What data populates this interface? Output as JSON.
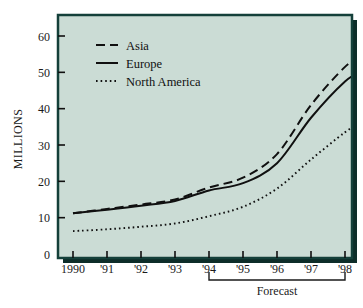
{
  "colors": {
    "plot_background": "#cbdcd5",
    "frame": "#14403a",
    "shadow": "#0d2d29",
    "page_background": "#ffffff",
    "line": "#101010",
    "text": "#1a1a1a"
  },
  "chart_data": {
    "type": "line",
    "title": "",
    "xlabel": "",
    "ylabel": "MILLIONS",
    "x": [
      1990,
      1991,
      1992,
      1993,
      1994,
      1995,
      1996,
      1997,
      1998,
      1998.5
    ],
    "tick_labels": [
      "1990",
      "'91",
      "'92",
      "'93",
      "'94",
      "'95",
      "'96",
      "'97",
      "'98"
    ],
    "y_ticks": [
      0,
      10,
      20,
      30,
      40,
      50,
      60
    ],
    "ylim": [
      0,
      65
    ],
    "xlim": [
      1989.5,
      1998.75
    ],
    "grid": false,
    "legend_position": "top-left",
    "series": [
      {
        "name": "Asia",
        "style": "dashed",
        "values": [
          11.2,
          12.4,
          13.6,
          15.0,
          18.3,
          21.0,
          27.5,
          41.0,
          51.5,
          54.5
        ]
      },
      {
        "name": "Europe",
        "style": "solid",
        "values": [
          11.2,
          12.2,
          13.3,
          14.6,
          17.5,
          19.5,
          25.0,
          37.5,
          47.5,
          50.2
        ]
      },
      {
        "name": "North America",
        "style": "dotted",
        "values": [
          6.3,
          6.8,
          7.5,
          8.4,
          10.4,
          13.0,
          18.0,
          26.0,
          33.5,
          36.5
        ]
      }
    ],
    "annotations": [
      {
        "name": "forecast-bracket",
        "label": "Forecast",
        "from_x": 1994,
        "to_x": 1998
      }
    ]
  },
  "legend": {
    "entries": [
      {
        "label": "Asia",
        "style": "dashed"
      },
      {
        "label": "Europe",
        "style": "solid"
      },
      {
        "label": "North America",
        "style": "dotted"
      }
    ]
  }
}
